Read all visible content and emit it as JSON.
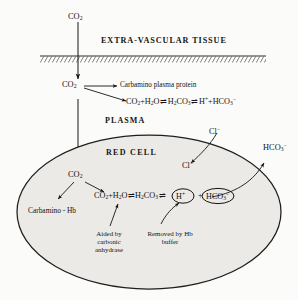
{
  "figure": {
    "type": "physiology-diagram",
    "background_color": "#fbfbf9",
    "ink_color": "#141414",
    "cell_fill_color": "#eceae6"
  },
  "compartments": {
    "tissue": {
      "label": "EXTRA-VASCULAR TISSUE",
      "membrane": "hatched-capillary-wall"
    },
    "plasma": {
      "label": "PLASMA"
    },
    "red_cell": {
      "label": "RED  CELL",
      "shape": "ellipse"
    }
  },
  "species": {
    "co2_tissue": {
      "formula": "CO",
      "sub": "2"
    },
    "co2_plasma": {
      "formula": "CO",
      "sub": "2"
    },
    "co2_cell": {
      "formula": "CO",
      "sub": "2"
    },
    "chloride_plasma": {
      "formula": "Cl",
      "sup": "−"
    },
    "chloride_cell": {
      "formula": "Cl",
      "sup": "−"
    },
    "bicarbonate_out": {
      "formula": "HCO",
      "sub": "3",
      "sup": "−"
    }
  },
  "plasma_reaction": {
    "text": "CO2 + H2O ⇌ H2CO3 ⇌ H+ + HCO3−",
    "parts": [
      {
        "base": "CO",
        "sub": "2"
      },
      {
        "base": "+H",
        "sub": "2"
      },
      {
        "base": "O",
        "sub": ""
      },
      {
        "op": "⇌"
      },
      {
        "base": "H",
        "sub": "2"
      },
      {
        "base": "CO",
        "sub": "3"
      },
      {
        "op": "⇌"
      },
      {
        "base": "H",
        "sup": "+"
      },
      {
        "base": "+HCO",
        "sub": "3",
        "sup": "−"
      }
    ]
  },
  "cell_reaction": {
    "text": "CO2 + H2O ⇌ H2CO3 ⇌ (H+) + (HCO3−)",
    "circled": [
      "H+",
      "HCO3-"
    ]
  },
  "pathways": {
    "carbamino_plasma": "Carbamino plasma protein",
    "carbamino_hb": "Carbamino - Hb"
  },
  "annotations": {
    "carbonic_anhydrase": "Aided by carbonic anhydrase",
    "hb_buffer": "Removed by Hb  buffer"
  },
  "transport": {
    "co2_entry": "CO2 diffuses from tissue into plasma and then into the red cell",
    "chloride_shift": "Cl− moves from plasma into the red cell",
    "bicarbonate_exit": "HCO3− moves from the red cell out into plasma"
  }
}
